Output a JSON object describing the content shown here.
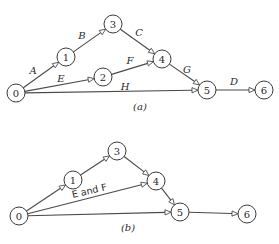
{
  "diagrams": [
    {
      "id": "a",
      "caption": "(a)",
      "caption_pos": [
        140,
        110
      ],
      "node_radius": 9,
      "nodes": [
        {
          "id": "0",
          "label": "0",
          "x": 16,
          "y": 93
        },
        {
          "id": "1",
          "label": "1",
          "x": 66,
          "y": 57
        },
        {
          "id": "2",
          "label": "2",
          "x": 103,
          "y": 77
        },
        {
          "id": "3",
          "label": "3",
          "x": 113,
          "y": 24
        },
        {
          "id": "4",
          "label": "4",
          "x": 162,
          "y": 59
        },
        {
          "id": "5",
          "label": "5",
          "x": 207,
          "y": 90
        },
        {
          "id": "6",
          "label": "6",
          "x": 264,
          "y": 90
        }
      ],
      "edges": [
        {
          "from": "0",
          "to": "1",
          "label": "A",
          "label_pos": [
            33,
            74
          ]
        },
        {
          "from": "1",
          "to": "3",
          "label": "B",
          "label_pos": [
            82,
            39
          ]
        },
        {
          "from": "3",
          "to": "4",
          "label": "C",
          "label_pos": [
            139,
            36
          ]
        },
        {
          "from": "0",
          "to": "2",
          "label": "E",
          "label_pos": [
            61,
            82
          ]
        },
        {
          "from": "2",
          "to": "4",
          "label": "F",
          "label_pos": [
            130,
            64
          ]
        },
        {
          "from": "4",
          "to": "5",
          "label": "G",
          "label_pos": [
            187,
            73
          ]
        },
        {
          "from": "0",
          "to": "5",
          "label": "H",
          "label_pos": [
            125,
            90
          ]
        },
        {
          "from": "5",
          "to": "6",
          "label": "D",
          "label_pos": [
            234,
            85
          ]
        }
      ]
    },
    {
      "id": "b",
      "caption": "(b)",
      "caption_pos": [
        128,
        231
      ],
      "node_radius": 9,
      "nodes": [
        {
          "id": "0",
          "label": "0",
          "x": 19,
          "y": 216
        },
        {
          "id": "1",
          "label": "1",
          "x": 73,
          "y": 180
        },
        {
          "id": "3",
          "label": "3",
          "x": 117,
          "y": 151
        },
        {
          "id": "4",
          "label": "4",
          "x": 156,
          "y": 181
        },
        {
          "id": "5",
          "label": "5",
          "x": 180,
          "y": 212
        },
        {
          "id": "6",
          "label": "6",
          "x": 247,
          "y": 214
        }
      ],
      "edges": [
        {
          "from": "0",
          "to": "1",
          "label": ""
        },
        {
          "from": "1",
          "to": "3",
          "label": ""
        },
        {
          "from": "3",
          "to": "4",
          "label": ""
        },
        {
          "from": "0",
          "to": "4",
          "label": "E and F",
          "label_pos": [
            90,
            194
          ],
          "label_rotate": -13
        },
        {
          "from": "4",
          "to": "5",
          "label": ""
        },
        {
          "from": "0",
          "to": "5",
          "label": ""
        },
        {
          "from": "5",
          "to": "6",
          "label": ""
        }
      ]
    }
  ]
}
